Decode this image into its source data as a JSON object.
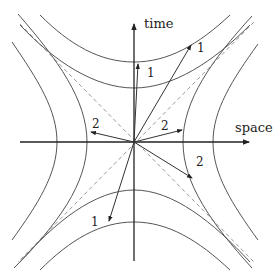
{
  "diagram": {
    "axes": {
      "time_label": "time",
      "space_label": "space"
    },
    "vectors": [
      {
        "id": "t1a",
        "label": "1",
        "kind": "timelike"
      },
      {
        "id": "t1b",
        "label": "1",
        "kind": "timelike"
      },
      {
        "id": "t1c",
        "label": "1",
        "kind": "timelike"
      },
      {
        "id": "s2a",
        "label": "2",
        "kind": "spacelike"
      },
      {
        "id": "s2b",
        "label": "2",
        "kind": "spacelike"
      },
      {
        "id": "s2c",
        "label": "2",
        "kind": "spacelike"
      }
    ],
    "light_cone": "dashed diagonal lines",
    "colors": {
      "axis": "#222222",
      "curve": "#555555",
      "dashed": "#999999",
      "vector": "#333333"
    }
  }
}
